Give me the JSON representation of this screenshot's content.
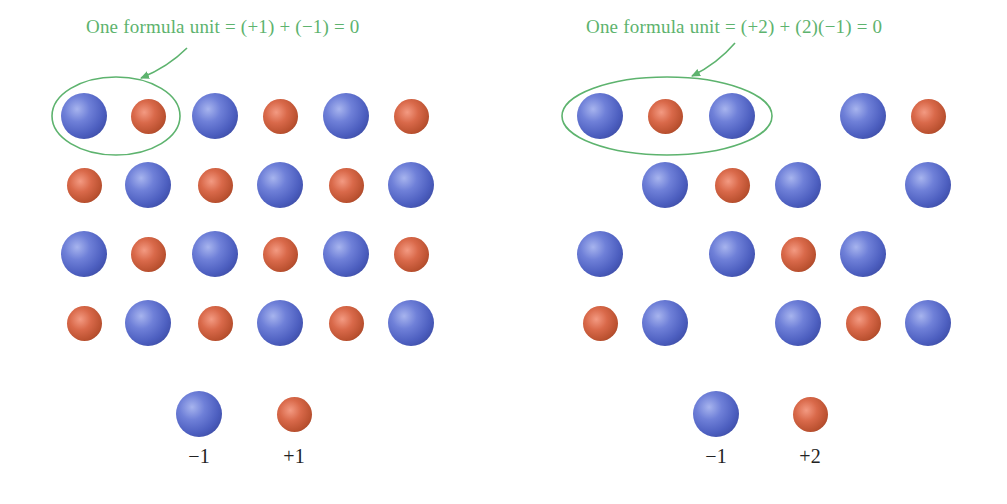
{
  "panels": [
    {
      "id": "left",
      "caption": "One formula unit = (+1) + (−1) = 0",
      "caption_pos": {
        "x": 86,
        "y": 16
      },
      "colors": {
        "annotation": "#5db36e",
        "anion": "#5566c8",
        "cation": "#c8573a"
      },
      "lattice": {
        "rows": [
          [
            "anion",
            "cation",
            "anion",
            "cation",
            "anion",
            "cation"
          ],
          [
            "cation",
            "anion",
            "cation",
            "anion",
            "cation",
            "anion"
          ],
          [
            "anion",
            "cation",
            "anion",
            "cation",
            "anion",
            "cation"
          ],
          [
            "cation",
            "anion",
            "cation",
            "anion",
            "cation",
            "anion"
          ]
        ],
        "col_x": [
          84,
          148,
          215,
          280,
          346,
          411
        ],
        "row_y": [
          116,
          185,
          254,
          323
        ]
      },
      "ellipse": {
        "cx": 116,
        "cy": 116,
        "rx": 64,
        "ry": 39
      },
      "arrow": {
        "x1": 187,
        "y1": 48,
        "x2": 141,
        "y2": 78
      },
      "legend": [
        {
          "type": "anion",
          "x": 199,
          "y": 414,
          "label": "−1"
        },
        {
          "type": "cation",
          "x": 294,
          "y": 414,
          "label": "+1"
        }
      ]
    },
    {
      "id": "right",
      "caption": "One formula unit = (+2) + (2)(−1) = 0",
      "caption_pos": {
        "x": 586,
        "y": 16
      },
      "colors": {
        "annotation": "#5db36e",
        "anion": "#5566c8",
        "cation": "#c8573a"
      },
      "lattice": {
        "rows": [
          [
            "anion",
            "cation",
            "anion",
            null,
            "anion",
            "cation"
          ],
          [
            null,
            "anion",
            "cation",
            "anion",
            null,
            "anion"
          ],
          [
            "anion",
            null,
            "anion",
            "cation",
            "anion",
            null
          ],
          [
            "cation",
            "anion",
            null,
            "anion",
            "cation",
            "anion"
          ]
        ],
        "col_x": [
          600,
          665,
          732,
          798,
          863,
          928
        ],
        "row_y": [
          116,
          185,
          254,
          323
        ]
      },
      "ellipse": {
        "cx": 667,
        "cy": 116,
        "rx": 105,
        "ry": 39
      },
      "arrow": {
        "x1": 735,
        "y1": 43,
        "x2": 692,
        "y2": 76
      },
      "legend": [
        {
          "type": "anion",
          "x": 716,
          "y": 414,
          "label": "−1"
        },
        {
          "type": "cation",
          "x": 810,
          "y": 414,
          "label": "+2"
        }
      ]
    }
  ]
}
